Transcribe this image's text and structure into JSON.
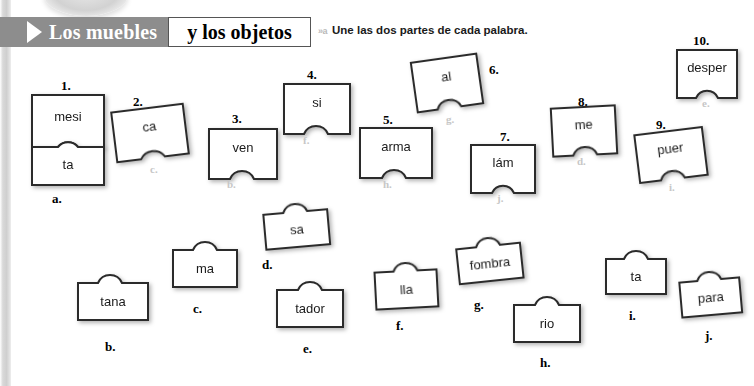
{
  "header": {
    "banner_title": "Los muebles",
    "boxed_title": "y los objetos",
    "arrow_icon": "play-triangle-icon"
  },
  "instruction": {
    "marker": "»a",
    "text": "Une las dos partes de cada palabra."
  },
  "exercise": {
    "top_pieces": [
      {
        "number": "1.",
        "text": "mesi",
        "answer": "",
        "connector": "tab-bottom"
      },
      {
        "number": "2.",
        "text": "ca",
        "answer": "c.",
        "connector": "notch-bottom"
      },
      {
        "number": "3.",
        "text": "ven",
        "answer": "b.",
        "connector": "notch-bottom"
      },
      {
        "number": "4.",
        "text": "si",
        "answer": "f.",
        "connector": "notch-bottom"
      },
      {
        "number": "5.",
        "text": "arma",
        "answer": "h.",
        "connector": "notch-bottom"
      },
      {
        "number": "6.",
        "text": "al",
        "answer": "g.",
        "connector": "notch-bottom"
      },
      {
        "number": "7.",
        "text": "lám",
        "answer": "j.",
        "connector": "notch-bottom"
      },
      {
        "number": "8.",
        "text": "me",
        "answer": "d.",
        "connector": "notch-bottom"
      },
      {
        "number": "9.",
        "text": "puer",
        "answer": "i.",
        "connector": "notch-bottom"
      },
      {
        "number": "10.",
        "text": "desper",
        "answer": "e.",
        "connector": "notch-bottom"
      }
    ],
    "attached_piece": {
      "letter": "a.",
      "text": "ta",
      "connector": "notch-top"
    },
    "bottom_pieces": [
      {
        "letter": "b.",
        "text": "tana",
        "connector": "tab-top"
      },
      {
        "letter": "c.",
        "text": "ma",
        "connector": "tab-top"
      },
      {
        "letter": "d.",
        "text": "sa",
        "connector": "tab-top"
      },
      {
        "letter": "e.",
        "text": "tador",
        "connector": "tab-top"
      },
      {
        "letter": "f.",
        "text": "lla",
        "connector": "tab-top"
      },
      {
        "letter": "g.",
        "text": "fombra",
        "connector": "tab-top"
      },
      {
        "letter": "h.",
        "text": "rio",
        "connector": "tab-top"
      },
      {
        "letter": "i.",
        "text": "ta",
        "connector": "tab-top"
      },
      {
        "letter": "j.",
        "text": "para",
        "connector": "tab-top"
      }
    ]
  },
  "colors": {
    "banner_gray": "#8d8d8d",
    "piece_outline": "#2b2b2b",
    "answer_gray": "#c7c7c7",
    "page_white": "#ffffff"
  }
}
